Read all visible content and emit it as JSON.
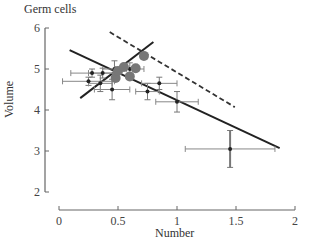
{
  "chart_data": {
    "type": "scatter",
    "title": "Germ cells",
    "xlabel": "Number",
    "ylabel": "Volume",
    "xlim": [
      0,
      2
    ],
    "ylim": [
      2,
      6
    ],
    "x_ticks": [
      0,
      0.5,
      1,
      1.5,
      2
    ],
    "x_tick_labels": [
      "0",
      "0.5",
      "1",
      "1.5",
      "2"
    ],
    "y_ticks": [
      2,
      3,
      4,
      5,
      6
    ],
    "y_tick_labels": [
      "2",
      "3",
      "4",
      "5",
      "6"
    ],
    "grid": false,
    "legend": null,
    "series": [
      {
        "name": "points with error bars",
        "marker": "small-black-dot",
        "color": "#222222",
        "points": [
          {
            "x": 0.25,
            "y": 4.7,
            "xerr": 0.22,
            "yerr": 0.1
          },
          {
            "x": 0.28,
            "y": 4.9,
            "xerr": 0.18,
            "yerr": 0.1
          },
          {
            "x": 0.37,
            "y": 4.9,
            "xerr": 0.12,
            "yerr": 0.12
          },
          {
            "x": 0.35,
            "y": 4.65,
            "xerr": 0.1,
            "yerr": 0.2
          },
          {
            "x": 0.45,
            "y": 4.5,
            "xerr": 0.15,
            "yerr": 0.25
          },
          {
            "x": 0.47,
            "y": 5.0,
            "xerr": 0.1,
            "yerr": 0.2
          },
          {
            "x": 0.6,
            "y": 5.0,
            "xerr": 0.12,
            "yerr": 0.15
          },
          {
            "x": 0.75,
            "y": 4.45,
            "xerr": 0.1,
            "yerr": 0.2
          },
          {
            "x": 0.85,
            "y": 4.65,
            "xerr": 0.15,
            "yerr": 0.15
          },
          {
            "x": 1.0,
            "y": 4.2,
            "xerr": 0.18,
            "yerr": 0.25
          },
          {
            "x": 1.45,
            "y": 3.05,
            "xerr": 0.38,
            "yerr": 0.45
          }
        ]
      },
      {
        "name": "large grey points",
        "marker": "large-grey-dot",
        "color": "#777777",
        "points": [
          {
            "x": 0.48,
            "y": 4.78
          },
          {
            "x": 0.5,
            "y": 4.95
          },
          {
            "x": 0.55,
            "y": 5.05
          },
          {
            "x": 0.65,
            "y": 5.02
          },
          {
            "x": 0.6,
            "y": 4.82
          },
          {
            "x": 0.72,
            "y": 5.32
          }
        ]
      }
    ],
    "lines": [
      {
        "name": "decreasing fit",
        "style": "solid",
        "color": "#222222",
        "x": [
          0.09,
          1.87
        ],
        "y": [
          5.46,
          3.07
        ]
      },
      {
        "name": "increasing fit",
        "style": "solid",
        "color": "#222222",
        "x": [
          0.18,
          0.8
        ],
        "y": [
          4.29,
          5.66
        ]
      },
      {
        "name": "dashed reference",
        "style": "dashed",
        "color": "#333333",
        "x": [
          0.43,
          1.49
        ],
        "y": [
          5.9,
          4.07
        ]
      }
    ]
  }
}
